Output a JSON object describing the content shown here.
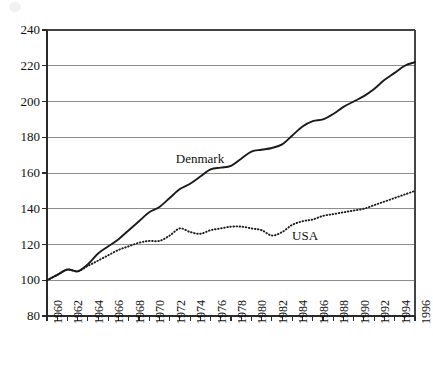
{
  "chart_data": {
    "type": "line",
    "title": "",
    "subtitle": "",
    "xlabel": "",
    "ylabel": "",
    "xlim": [
      1960,
      1996
    ],
    "ylim": [
      80,
      240
    ],
    "yticks": [
      80,
      100,
      120,
      140,
      160,
      180,
      200,
      220,
      240
    ],
    "xticks": [
      1960,
      1962,
      1964,
      1966,
      1968,
      1970,
      1972,
      1974,
      1976,
      1978,
      1980,
      1982,
      1984,
      1986,
      1988,
      1990,
      1992,
      1994,
      1996
    ],
    "xtick_labels": [
      "1960",
      "1962",
      "1964",
      "1966",
      "1968",
      "1970",
      "1972",
      "1974",
      "1976",
      "1978",
      "1980",
      "1982",
      "1984",
      "1986",
      "1988",
      "1990",
      "1992",
      "1994",
      "1996"
    ],
    "ytick_labels": [
      "80",
      "100",
      "120",
      "140",
      "160",
      "180",
      "200",
      "220",
      "240"
    ],
    "grid": true,
    "grid_axis": "y",
    "legend": "inline-annotations",
    "x": [
      1960,
      1961,
      1962,
      1963,
      1964,
      1965,
      1966,
      1967,
      1968,
      1969,
      1970,
      1971,
      1972,
      1973,
      1974,
      1975,
      1976,
      1977,
      1978,
      1979,
      1980,
      1981,
      1982,
      1983,
      1984,
      1985,
      1986,
      1987,
      1988,
      1989,
      1990,
      1991,
      1992,
      1993,
      1994,
      1995,
      1996
    ],
    "series": [
      {
        "name": "Denmark",
        "style": "solid",
        "color": "#1a1a1a",
        "label_x": 1975,
        "label_y": 168,
        "values": [
          100,
          103,
          106,
          105,
          109,
          115,
          119,
          123,
          128,
          133,
          138,
          141,
          146,
          151,
          154,
          158,
          162,
          163,
          164,
          168,
          172,
          173,
          174,
          176,
          181,
          186,
          189,
          190,
          193,
          197,
          200,
          203,
          207,
          212,
          216,
          220,
          222
        ]
      },
      {
        "name": "USA",
        "style": "dotted",
        "color": "#1a1a1a",
        "label_x": 1985,
        "label_y": 125,
        "values": [
          100,
          103,
          106,
          105,
          108,
          111,
          114,
          117,
          119,
          121,
          122,
          122,
          125,
          129,
          127,
          126,
          128,
          129,
          130,
          130,
          129,
          128,
          125,
          127,
          131,
          133,
          134,
          136,
          137,
          138,
          139,
          140,
          142,
          144,
          146,
          148,
          150
        ]
      }
    ]
  },
  "axes": {
    "y_axis_name": "index",
    "x_axis_name": "year"
  }
}
